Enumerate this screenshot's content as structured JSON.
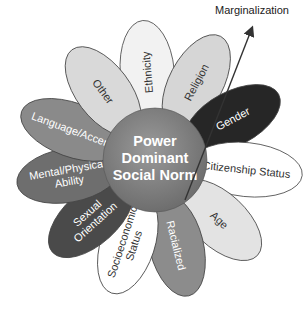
{
  "diagram": {
    "center": {
      "lines": [
        "Power",
        "Dominant",
        "Social Norm"
      ],
      "fill": "#7a7a7a"
    },
    "arrow": {
      "label": "Marginalization",
      "color": "#333333"
    },
    "petals": [
      {
        "label_lines": [
          "Ethnicity"
        ],
        "fill": "#f2f2f2",
        "text_color": "#333333"
      },
      {
        "label_lines": [
          "Religion"
        ],
        "fill": "#d6d6d6",
        "text_color": "#333333"
      },
      {
        "label_lines": [
          "Gender"
        ],
        "fill": "#262626",
        "text_color": "#ffffff"
      },
      {
        "label_lines": [
          "Citizenship Status"
        ],
        "fill": "#ffffff",
        "text_color": "#333333"
      },
      {
        "label_lines": [
          "Age"
        ],
        "fill": "#e3e3e3",
        "text_color": "#333333"
      },
      {
        "label_lines": [
          "Racialized"
        ],
        "fill": "#8c8c8c",
        "text_color": "#ffffff"
      },
      {
        "label_lines": [
          "Socioeconomic",
          "Status"
        ],
        "fill": "#ffffff",
        "text_color": "#333333"
      },
      {
        "label_lines": [
          "Sexual",
          "Orientation"
        ],
        "fill": "#4a4a4a",
        "text_color": "#ffffff"
      },
      {
        "label_lines": [
          "Mental/Physical",
          "Ability"
        ],
        "fill": "#6e6e6e",
        "text_color": "#ffffff"
      },
      {
        "label_lines": [
          "Language/Accent"
        ],
        "fill": "#8a8a8a",
        "text_color": "#ffffff"
      },
      {
        "label_lines": [
          "Other"
        ],
        "fill": "#d9d9d9",
        "text_color": "#333333"
      }
    ]
  }
}
